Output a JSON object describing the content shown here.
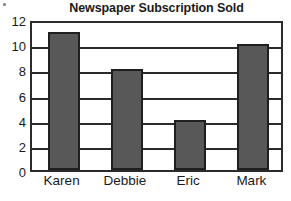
{
  "chart_data": {
    "type": "bar",
    "title": "Newspaper Subscription Sold",
    "xlabel": "",
    "ylabel": "",
    "categories": [
      "Karen",
      "Debbie",
      "Eric",
      "Mark"
    ],
    "values": [
      11,
      8,
      4,
      10
    ],
    "series": [
      {
        "name": "Subscriptions Sold",
        "values": [
          11,
          8,
          4,
          10
        ]
      }
    ],
    "ylim": [
      0,
      12
    ],
    "y_ticks": [
      0,
      2,
      4,
      6,
      8,
      10,
      12
    ],
    "y_tick_labels": [
      "0",
      "2",
      "4",
      "6",
      "8",
      "10",
      "12"
    ],
    "grid": true,
    "grid_axis": "y",
    "legend": false,
    "legend_position": "none",
    "annotations": [],
    "colors": {
      "bar_fill": "#585858",
      "bar_edge": "#1f1f1f",
      "axis": "#2b2b2b",
      "grid": "#2b2b2b",
      "text": "#1a1a1a",
      "background": "#ffffff"
    }
  }
}
